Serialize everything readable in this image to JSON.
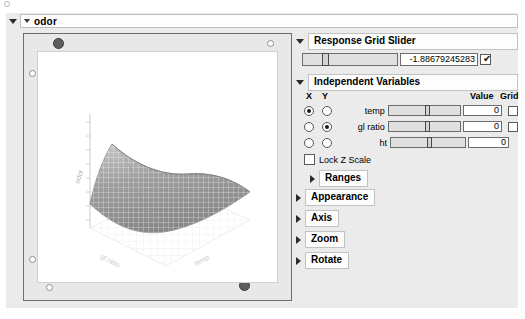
{
  "window": {
    "title": "odor"
  },
  "plot": {
    "z_axis_label": "odor",
    "x_axis_label": "gl ratio",
    "y_axis_label": "temp",
    "surface_type": "saddle",
    "surface_color": "#9a9a9a",
    "background": "#ffffff"
  },
  "response_grid_slider": {
    "title": "Response Grid Slider",
    "value": "-1.88679245283",
    "checkbox_checked": true
  },
  "independent_variables": {
    "title": "Independent Variables",
    "columns": {
      "x": "X",
      "y": "Y",
      "value": "Value",
      "grid": "Grid"
    },
    "rows": [
      {
        "name": "temp",
        "x_selected": true,
        "y_selected": false,
        "value": "0",
        "has_grid": true,
        "grid_checked": false
      },
      {
        "name": "gl ratio",
        "x_selected": false,
        "y_selected": true,
        "value": "0",
        "has_grid": true,
        "grid_checked": false
      },
      {
        "name": "ht",
        "x_selected": false,
        "y_selected": false,
        "value": "0",
        "has_grid": false,
        "grid_checked": false
      }
    ],
    "lock_z_scale": {
      "label": "Lock Z Scale",
      "checked": false
    }
  },
  "sections": [
    {
      "label": "Ranges",
      "expanded": false,
      "indent": 14
    },
    {
      "label": "Appearance",
      "expanded": false,
      "indent": 0
    },
    {
      "label": "Axis",
      "expanded": false,
      "indent": 0
    },
    {
      "label": "Zoom",
      "expanded": false,
      "indent": 0
    },
    {
      "label": "Rotate",
      "expanded": false,
      "indent": 0
    }
  ]
}
